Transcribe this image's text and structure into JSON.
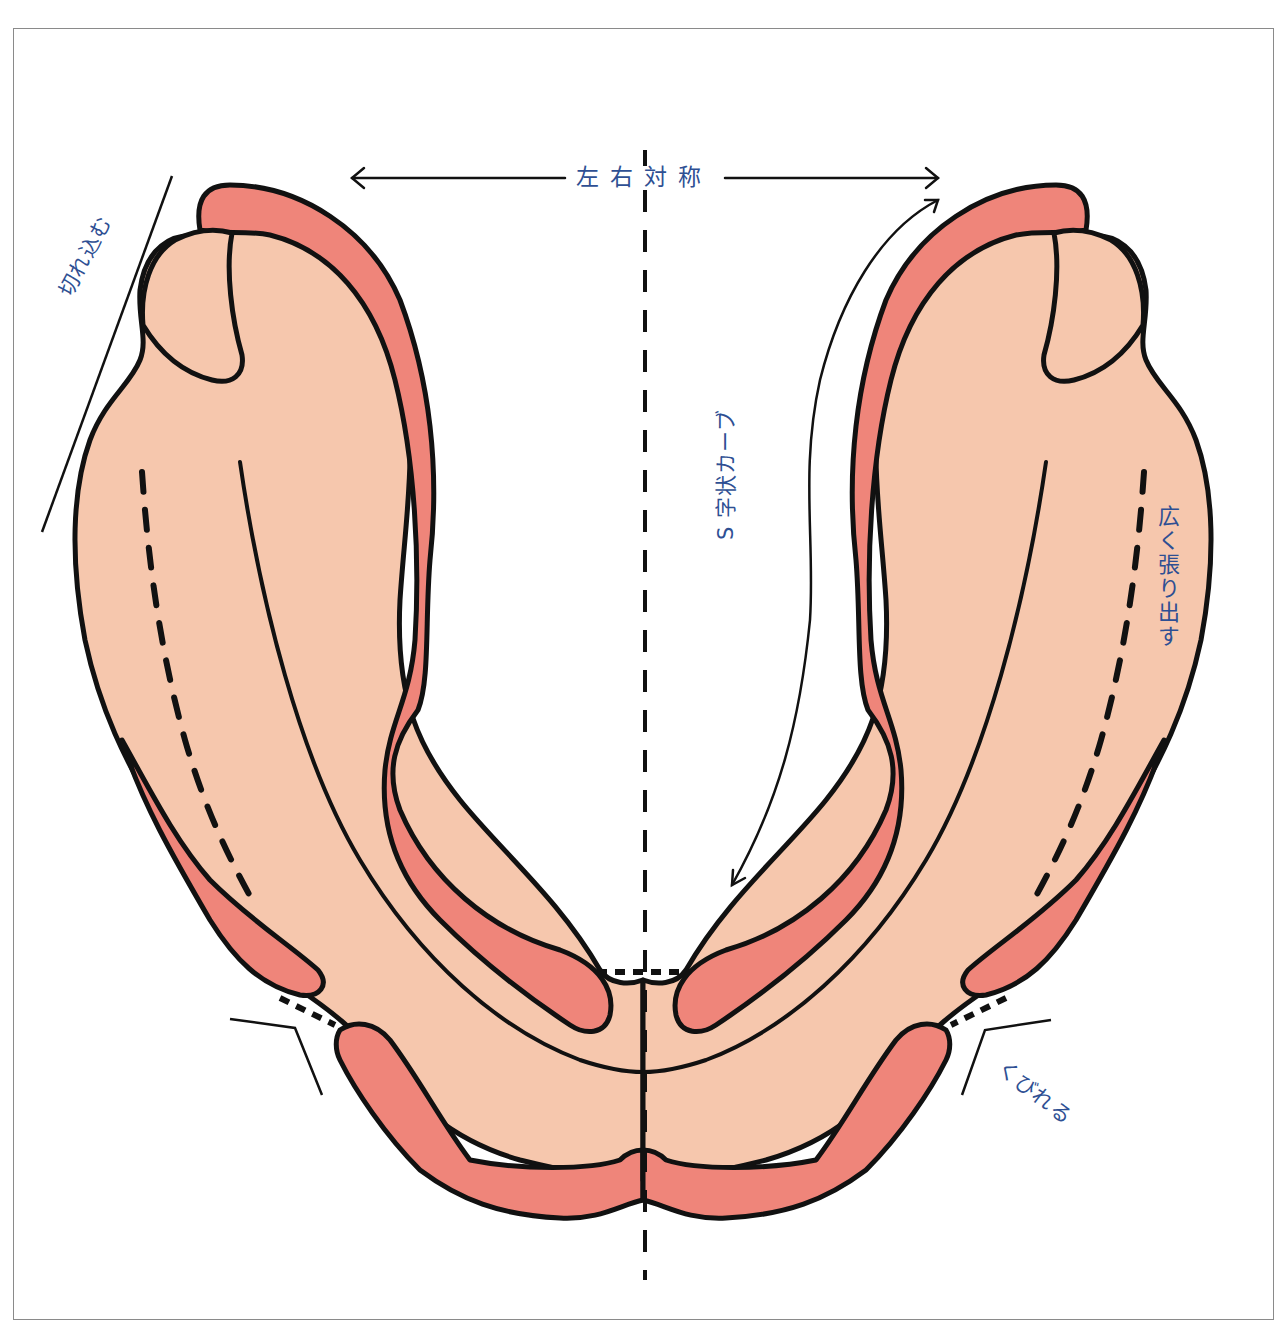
{
  "diagram": {
    "title": "左右対称",
    "colors": {
      "base_fill": "#f6c7ad",
      "flange_fill": "#ef857a",
      "outline": "#111111",
      "label_text": "#2e4f93",
      "frame_border": "#8a8a8a"
    },
    "labels": {
      "symmetry": "左右対称",
      "cut_in": "切れ込む",
      "s_curve": "S 字状カーブ",
      "expand": "広く張り出す",
      "narrow": "くびれる"
    },
    "annotations": [
      {
        "id": "symmetry",
        "text": "左右対称",
        "type": "double-arrow",
        "orientation": "horizontal"
      },
      {
        "id": "cut_in",
        "text": "切れ込む",
        "type": "guide-line",
        "orientation": "diagonal"
      },
      {
        "id": "s_curve",
        "text": "S 字状カーブ",
        "type": "curved-double-arrow",
        "orientation": "vertical"
      },
      {
        "id": "expand",
        "text": "広く張り出す",
        "type": "text",
        "orientation": "vertical"
      },
      {
        "id": "narrow",
        "text": "くびれる",
        "type": "angle-marker",
        "orientation": "diagonal"
      }
    ],
    "axis": {
      "type": "dashed-centerline",
      "orientation": "vertical"
    }
  }
}
